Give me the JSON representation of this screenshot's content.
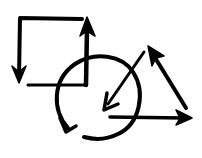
{
  "diagram": {
    "title": "",
    "background": "#ffffff",
    "ink_color": "#000000",
    "shapes": [
      {
        "name": "square",
        "label": ""
      },
      {
        "name": "circle",
        "label": ""
      },
      {
        "name": "triangle",
        "label": ""
      }
    ],
    "arrows": [
      {
        "name": "square-top-left-down-arrow",
        "direction": "down"
      },
      {
        "name": "square-right-up-arrow",
        "direction": "up"
      },
      {
        "name": "circle-clockwise-arrow",
        "direction": "clockwise"
      },
      {
        "name": "triangle-left-edge-arrow",
        "direction": "down-left"
      },
      {
        "name": "triangle-right-edge-arrow",
        "direction": "up-left"
      },
      {
        "name": "triangle-bottom-edge-arrow",
        "direction": "right"
      }
    ]
  }
}
